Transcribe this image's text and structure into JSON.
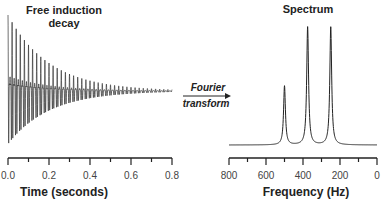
{
  "chart_data": [
    {
      "type": "line",
      "title": "Free induction decay",
      "title_lines": [
        "Free induction",
        "decay"
      ],
      "xlabel": "Time (seconds)",
      "ylabel": "",
      "xlim": [
        0,
        0.8
      ],
      "x_ticks": [
        0.0,
        0.1,
        0.2,
        0.3,
        0.4,
        0.5,
        0.6,
        0.7,
        0.8
      ],
      "x_tick_labels": [
        "0.0",
        "0.2",
        "0.4",
        "0.6",
        "0.8"
      ],
      "signal": {
        "description": "Decaying oscillating signal with beat pattern (sum of three frequencies)",
        "frequencies_hz": [
          500,
          375,
          250
        ],
        "relative_amplitudes": [
          0.5,
          1.0,
          1.0
        ],
        "decay_time_s": 0.2,
        "duration_s": 0.8
      }
    },
    {
      "type": "line",
      "title": "Spectrum",
      "xlabel": "Frequency (Hz)",
      "ylabel": "",
      "xlim": [
        800,
        0
      ],
      "x_ticks": [
        800,
        700,
        600,
        500,
        400,
        300,
        200,
        100,
        0
      ],
      "x_tick_labels": [
        "800",
        "600",
        "400",
        "200",
        "0"
      ],
      "peaks": [
        {
          "frequency_hz": 500,
          "relative_height": 0.5
        },
        {
          "frequency_hz": 375,
          "relative_height": 1.0
        },
        {
          "frequency_hz": 250,
          "relative_height": 1.0
        }
      ],
      "lineshape": "lorentzian"
    }
  ],
  "arrow": {
    "label_top": "Fourier",
    "label_bottom": "transform"
  }
}
